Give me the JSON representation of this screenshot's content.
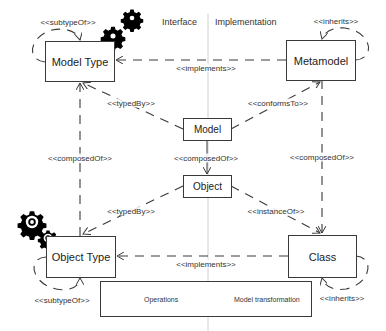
{
  "headers": {
    "interface": "Interface",
    "implementation": "Implementation"
  },
  "nodes": {
    "model_type": "Model Type",
    "metamodel": "Metamodel",
    "model": "Model",
    "object": "Object",
    "object_type": "Object Type",
    "class": "Class"
  },
  "relations": {
    "model_type_self": "<<subtypeOf>>",
    "metamodel_self": "<<inherits>>",
    "model_type_metamodel": "<<implements>>",
    "model_typed_by": "<<typedBy>>",
    "model_conforms_to": "<<conformsTo>>",
    "left_composed_of": "<<composedOf>>",
    "model_object_composed_of": "<<composedOf>>",
    "right_composed_of": "<<composedOf>>",
    "object_typed_by": "<<typedBy>>",
    "object_instance_of": "<<instanceOf>>",
    "object_type_class": "<<implements>>",
    "object_type_self": "<<subtypeOf>>",
    "class_self": "<<inherits>>"
  },
  "legend": {
    "operations": "Operations",
    "model_transformation": "Model transformation"
  },
  "colors": {
    "line": "#3a3a3a",
    "divider": "#d0d0d0",
    "gear": "#000000"
  }
}
